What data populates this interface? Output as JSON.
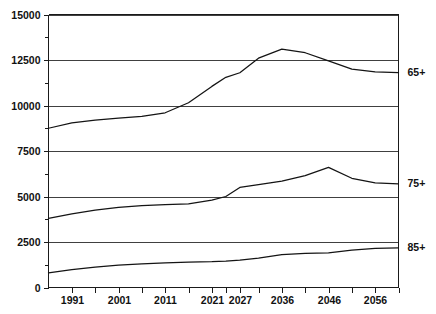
{
  "chart_data": {
    "type": "line",
    "title": "",
    "subtitle": "",
    "xlabel": "",
    "ylabel": "",
    "xlim": [
      1986,
      2061
    ],
    "ylim": [
      0,
      15000
    ],
    "grid": true,
    "legend_position": "right-inline",
    "y_ticks": [
      0,
      2500,
      5000,
      7500,
      10000,
      12500,
      15000
    ],
    "y_tick_labels": [
      "0",
      "2500",
      "5000",
      "7500",
      "10000",
      "12500",
      "15000"
    ],
    "y_minor_ticks": [
      1250,
      3750,
      6250,
      8750,
      11250,
      13750
    ],
    "x_ticks": [
      1991,
      1996,
      2001,
      2006,
      2011,
      2016,
      2021,
      2024,
      2027,
      2031,
      2036,
      2041,
      2046,
      2051,
      2056,
      2061
    ],
    "x_tick_labels": [
      "1991",
      "2001",
      "2011",
      "2021",
      "2027",
      "2036",
      "2046",
      "2056"
    ],
    "x_labelled_ticks": [
      1991,
      2001,
      2011,
      2021,
      2027,
      2036,
      2046,
      2056
    ],
    "series": [
      {
        "name": "65+",
        "label": "65+",
        "color": "#141414",
        "x": [
          1986,
          1991,
          1996,
          2001,
          2006,
          2011,
          2016,
          2021,
          2024,
          2027,
          2031,
          2036,
          2041,
          2046,
          2051,
          2056,
          2061
        ],
        "values": [
          8750,
          9050,
          9200,
          9300,
          9400,
          9600,
          10150,
          11050,
          11550,
          11800,
          12600,
          13100,
          12900,
          12450,
          12000,
          11850,
          11800
        ]
      },
      {
        "name": "75+",
        "label": "75+",
        "color": "#141414",
        "x": [
          1986,
          1991,
          1996,
          2001,
          2006,
          2011,
          2016,
          2021,
          2024,
          2027,
          2031,
          2036,
          2041,
          2046,
          2051,
          2056,
          2061
        ],
        "values": [
          3800,
          4050,
          4250,
          4400,
          4500,
          4550,
          4600,
          4800,
          5000,
          5500,
          5650,
          5850,
          6150,
          6600,
          6000,
          5750,
          5700
        ]
      },
      {
        "name": "85+",
        "label": "85+",
        "color": "#141414",
        "x": [
          1986,
          1991,
          1996,
          2001,
          2006,
          2011,
          2016,
          2021,
          2024,
          2027,
          2031,
          2036,
          2041,
          2046,
          2051,
          2056,
          2061
        ],
        "values": [
          800,
          980,
          1120,
          1230,
          1300,
          1350,
          1400,
          1420,
          1450,
          1500,
          1620,
          1800,
          1880,
          1900,
          2050,
          2150,
          2180
        ]
      }
    ]
  }
}
